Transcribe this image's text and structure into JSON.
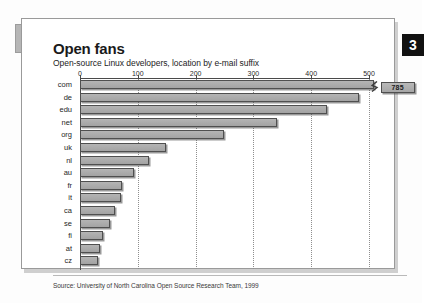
{
  "panel": {
    "badge": "3",
    "title": "Open fans",
    "subtitle": "Open-source Linux developers, location by e-mail suffix",
    "source": "Source: University of North Carolina Open Source Research Team, 1999"
  },
  "colors": {
    "badge_background": "#111111",
    "badge_text": "#ffffff",
    "bar_fill": "#ababab",
    "bar_stroke": "#4f4f4f",
    "panel_border": "#9a9a9a",
    "gridline": "#8e8e8e",
    "axis": "#4a4a4a",
    "left_tab": "#b6b6b6"
  },
  "chart_data": {
    "type": "bar",
    "orientation": "horizontal",
    "title": "Open fans",
    "subtitle": "Open-source Linux developers, location by e-mail suffix",
    "xlabel": "",
    "ylabel": "",
    "xlim": [
      0,
      500
    ],
    "xticks": [
      0,
      100,
      200,
      300,
      400,
      500
    ],
    "xticklabels": [
      "0",
      "100",
      "200",
      "300",
      "400",
      "500"
    ],
    "grid": "vertical-dotted",
    "legend": null,
    "axis_break": {
      "category": "com",
      "note": "bar exceeds axis maximum; drawn with zigzag break and value callout",
      "callout_label": "785"
    },
    "categories": [
      "com",
      "de",
      "edu",
      "net",
      "org",
      "uk",
      "nl",
      "au",
      "fr",
      "it",
      "ca",
      "se",
      "fi",
      "at",
      "cz"
    ],
    "values": [
      785,
      483,
      427,
      341,
      249,
      149,
      119,
      94,
      73,
      71,
      61,
      52,
      40,
      34,
      31
    ],
    "annotations": [
      {
        "text": "785",
        "category": "com"
      }
    ],
    "source": "Source: University of North Carolina Open Source Research Team, 1999"
  }
}
